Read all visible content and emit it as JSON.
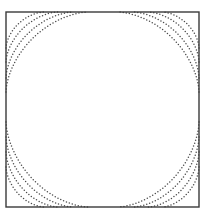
{
  "figure": {
    "title": "",
    "background_color": "#ffffff",
    "width": 206,
    "height": 220
  },
  "frame": {
    "name": "plot-border",
    "x": 6,
    "y": 12,
    "width": 193,
    "height": 195,
    "stroke_color": "#3a3a3a",
    "stroke_width": 1.4,
    "fill": "#ffffff"
  },
  "style": {
    "dot_color": "#4a4a4a",
    "dot_radius": 0.75,
    "dot_spacing": 3.1
  },
  "chart_data": {
    "type": "line",
    "title": "",
    "xlabel": "",
    "ylabel": "",
    "grid": false,
    "legend": "none",
    "rendering": "dotted-contour-lines",
    "xlim": [
      -1,
      1
    ],
    "ylim": [
      -1,
      1
    ],
    "axis_pixel_bounds": {
      "x_left": 6,
      "x_right": 199,
      "y_top": 12,
      "y_bottom": 207
    },
    "contour_family": "x*y = k (hyperbolas)",
    "levels": [
      0.055,
      0.115,
      0.2,
      0.31
    ],
    "curves_per_corner": 4,
    "corners": [
      "top-left",
      "top-right",
      "bottom-left",
      "bottom-right"
    ],
    "edge_intersections": {
      "top_edge_x": [
        44,
        58,
        73,
        88,
        118,
        133,
        148,
        162
      ],
      "bottom_edge_x": [
        44,
        58,
        73,
        88,
        118,
        133,
        148,
        162
      ],
      "left_edge_y": [
        48,
        62,
        78,
        92,
        122,
        137,
        152,
        167
      ],
      "right_edge_y": [
        48,
        62,
        78,
        92,
        122,
        137,
        152,
        167
      ]
    },
    "series": [
      {
        "name": "top-left-arc-1",
        "corner": "top-left",
        "level": 0.055,
        "edge_x": 44,
        "edge_y": 48
      },
      {
        "name": "top-left-arc-2",
        "corner": "top-left",
        "level": 0.115,
        "edge_x": 58,
        "edge_y": 62
      },
      {
        "name": "top-left-arc-3",
        "corner": "top-left",
        "level": 0.2,
        "edge_x": 73,
        "edge_y": 78
      },
      {
        "name": "top-left-arc-4",
        "corner": "top-left",
        "level": 0.31,
        "edge_x": 88,
        "edge_y": 92
      },
      {
        "name": "top-right-arc-1",
        "corner": "top-right",
        "level": 0.055,
        "edge_x": 162,
        "edge_y": 48
      },
      {
        "name": "top-right-arc-2",
        "corner": "top-right",
        "level": 0.115,
        "edge_x": 148,
        "edge_y": 62
      },
      {
        "name": "top-right-arc-3",
        "corner": "top-right",
        "level": 0.2,
        "edge_x": 133,
        "edge_y": 78
      },
      {
        "name": "top-right-arc-4",
        "corner": "top-right",
        "level": 0.31,
        "edge_x": 118,
        "edge_y": 92
      },
      {
        "name": "bottom-left-arc-1",
        "corner": "bottom-left",
        "level": 0.055,
        "edge_x": 44,
        "edge_y": 167
      },
      {
        "name": "bottom-left-arc-2",
        "corner": "bottom-left",
        "level": 0.115,
        "edge_x": 58,
        "edge_y": 152
      },
      {
        "name": "bottom-left-arc-3",
        "corner": "bottom-left",
        "level": 0.2,
        "edge_x": 73,
        "edge_y": 137
      },
      {
        "name": "bottom-left-arc-4",
        "corner": "bottom-left",
        "level": 0.31,
        "edge_x": 88,
        "edge_y": 122
      },
      {
        "name": "bottom-right-arc-1",
        "corner": "bottom-right",
        "level": 0.055,
        "edge_x": 162,
        "edge_y": 167
      },
      {
        "name": "bottom-right-arc-2",
        "corner": "bottom-right",
        "level": 0.115,
        "edge_x": 148,
        "edge_y": 152
      },
      {
        "name": "bottom-right-arc-3",
        "corner": "bottom-right",
        "level": 0.2,
        "edge_x": 133,
        "edge_y": 137
      },
      {
        "name": "bottom-right-arc-4",
        "corner": "bottom-right",
        "level": 0.31,
        "edge_x": 118,
        "edge_y": 122
      }
    ]
  }
}
